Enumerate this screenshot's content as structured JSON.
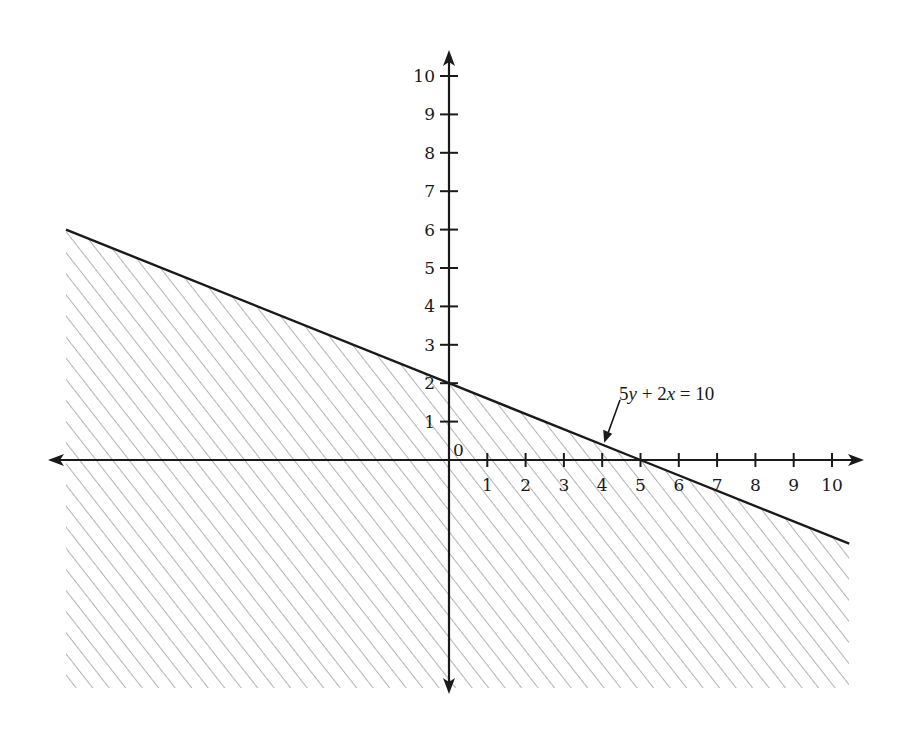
{
  "chart_data": {
    "type": "line",
    "title": "",
    "xlabel": "",
    "ylabel": "",
    "xlim": [
      -10.4,
      10.7
    ],
    "ylim": [
      -6,
      10.5
    ],
    "grid": false,
    "x_ticks": [
      1,
      2,
      3,
      4,
      5,
      6,
      7,
      8,
      9,
      10
    ],
    "y_ticks": [
      1,
      2,
      3,
      4,
      5,
      6,
      7,
      8,
      9,
      10
    ],
    "origin_label": "0",
    "series": [
      {
        "name": "5y + 2x = 10",
        "x": [
          -10,
          0,
          5,
          10.45
        ],
        "y": [
          6,
          2,
          0,
          -2.18
        ]
      }
    ],
    "shaded_region": {
      "description": "Region below the line 5y + 2x = 10 (5y + 2x ≤ 10) is hatched",
      "style": "diagonal hatching"
    },
    "annotations": [
      {
        "text": "5y + 2x = 10",
        "points_to": [
          4,
          0.4
        ]
      }
    ]
  },
  "colors": {
    "axis": "#1a1a1a",
    "line": "#1a1a1a",
    "hatch": "#8a8a8a",
    "background": "#ffffff"
  }
}
